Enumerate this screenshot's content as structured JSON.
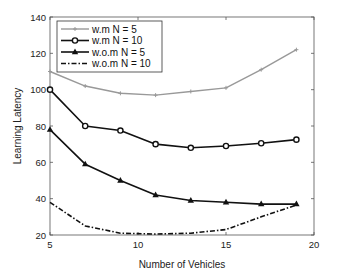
{
  "chart_data": {
    "type": "line",
    "title": "",
    "xlabel": "Number of Vehicles",
    "ylabel": "Learning Latency",
    "xlim": [
      5,
      20
    ],
    "ylim": [
      20,
      140
    ],
    "xticks": [
      5,
      10,
      15,
      20
    ],
    "yticks": [
      20,
      40,
      60,
      80,
      100,
      120,
      140
    ],
    "grid": false,
    "legend_position": "upper left",
    "x": [
      5,
      7,
      9,
      11,
      13,
      15,
      17,
      19
    ],
    "series": [
      {
        "name": "w.m N = 5",
        "color": "#999999",
        "marker": "plus",
        "dash": "solid",
        "values": [
          110,
          102,
          98,
          97,
          99,
          101,
          111,
          122
        ]
      },
      {
        "name": "w.m N = 10",
        "color": "#111111",
        "marker": "circle",
        "dash": "solid",
        "values": [
          100,
          80,
          77.5,
          70,
          68,
          69,
          70.5,
          72.5
        ]
      },
      {
        "name": "w.o.m N = 5",
        "color": "#111111",
        "marker": "triangle",
        "dash": "solid",
        "values": [
          78,
          59,
          50,
          42,
          39,
          38,
          37,
          37
        ]
      },
      {
        "name": "w.o.m N = 10",
        "color": "#111111",
        "marker": "none",
        "dash": "dashdot",
        "values": [
          38,
          25,
          21,
          20.5,
          21,
          23,
          30,
          36.5
        ]
      }
    ]
  }
}
